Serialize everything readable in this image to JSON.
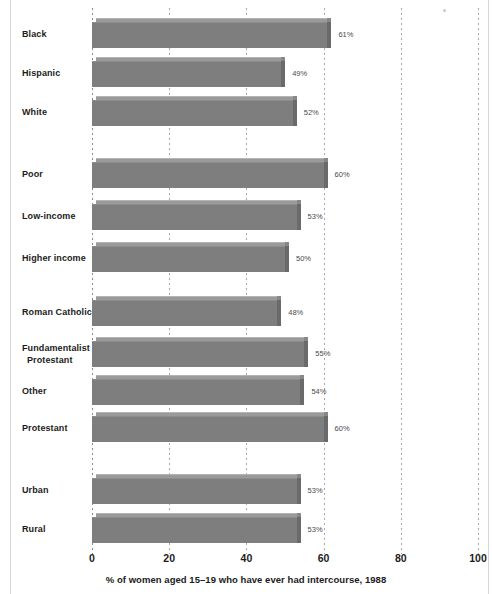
{
  "figure": {
    "axis_caption": "% of women aged 15–19 who have ever had intercourse, 1988",
    "bar_color": "#7e7e7e",
    "bar_top_color": "#9a9a9a",
    "bar_side_color": "#6a6a6a",
    "grid_color": "#a8a8a8",
    "text_color": "#1b1b1b"
  },
  "chart_data": {
    "type": "bar",
    "orientation": "horizontal",
    "title": "",
    "subtitle": "",
    "xlabel": "% of women aged 15–19 who have ever had intercourse, 1988",
    "ylabel": "",
    "xlim": [
      0,
      100
    ],
    "xticks": [
      0,
      20,
      40,
      60,
      80,
      100
    ],
    "xtick_labels": [
      "0",
      "20",
      "40",
      "60",
      "80",
      "100"
    ],
    "grid": true,
    "grid_axis": "x",
    "legend": false,
    "value_label_suffix": "%",
    "groups": [
      {
        "name": "Race and ethnicity",
        "categories": [
          "Black",
          "Hispanic",
          "White"
        ],
        "values": [
          61,
          49,
          52
        ],
        "value_labels": [
          "61%",
          "49%",
          "52%"
        ]
      },
      {
        "name": "Income",
        "categories": [
          "Poor",
          "Low-income",
          "Higher income"
        ],
        "values": [
          60,
          53,
          50
        ],
        "value_labels": [
          "60%",
          "53%",
          "50%"
        ]
      },
      {
        "name": "Religion",
        "categories": [
          "Roman Catholic",
          "Fundamentalist Protestant",
          "Other",
          "Protestant"
        ],
        "values": [
          48,
          55,
          54,
          60
        ],
        "value_labels": [
          "48%",
          "55%",
          "54%",
          "60%"
        ]
      },
      {
        "name": "Residence",
        "categories": [
          "Urban",
          "Rural"
        ],
        "values": [
          53,
          53
        ],
        "value_labels": [
          "53%",
          "53%"
        ]
      }
    ],
    "categories": [
      "Black",
      "Hispanic",
      "White",
      "Poor",
      "Low-income",
      "Higher income",
      "Roman Catholic",
      "Fundamentalist Protestant",
      "Other",
      "Protestant",
      "Urban",
      "Rural"
    ],
    "values": [
      61,
      49,
      52,
      60,
      53,
      50,
      48,
      55,
      54,
      60,
      53,
      53
    ]
  },
  "bars": [
    {
      "label": "Black",
      "label_line1": "Black",
      "label_line2": "",
      "value": 61,
      "value_label": "61%",
      "top": 18
    },
    {
      "label": "Hispanic",
      "label_line1": "Hispanic",
      "label_line2": "",
      "value": 49,
      "value_label": "49%",
      "top": 57
    },
    {
      "label": "White",
      "label_line1": "White",
      "label_line2": "",
      "value": 52,
      "value_label": "52%",
      "top": 96
    },
    {
      "label": "Poor",
      "label_line1": "Poor",
      "label_line2": "",
      "value": 60,
      "value_label": "60%",
      "top": 158
    },
    {
      "label": "Low-income",
      "label_line1": "Low-income",
      "label_line2": "",
      "value": 53,
      "value_label": "53%",
      "top": 200
    },
    {
      "label": "Higher income",
      "label_line1": "Higher income",
      "label_line2": "",
      "value": 50,
      "value_label": "50%",
      "top": 242
    },
    {
      "label": "Roman Catholic",
      "label_line1": "Roman Catholic",
      "label_line2": "",
      "value": 48,
      "value_label": "48%",
      "top": 296
    },
    {
      "label": "Fundamentalist Protestant",
      "label_line1": "Fundamentalist",
      "label_line2": "Protestant",
      "value": 55,
      "value_label": "55%",
      "top": 337
    },
    {
      "label": "Other",
      "label_line1": "Other",
      "label_line2": "",
      "value": 54,
      "value_label": "54%",
      "top": 375
    },
    {
      "label": "Protestant",
      "label_line1": "Protestant",
      "label_line2": "",
      "value": 60,
      "value_label": "60%",
      "top": 412
    },
    {
      "label": "Urban",
      "label_line1": "Urban",
      "label_line2": "",
      "value": 53,
      "value_label": "53%",
      "top": 474
    },
    {
      "label": "Rural",
      "label_line1": "Rural",
      "label_line2": "",
      "value": 53,
      "value_label": "53%",
      "top": 513
    }
  ],
  "axis": {
    "ticks": [
      {
        "value": 0,
        "label": "0"
      },
      {
        "value": 20,
        "label": "20"
      },
      {
        "value": 40,
        "label": "40"
      },
      {
        "value": 60,
        "label": "60"
      },
      {
        "value": 80,
        "label": "80"
      },
      {
        "value": 100,
        "label": "100"
      }
    ]
  }
}
